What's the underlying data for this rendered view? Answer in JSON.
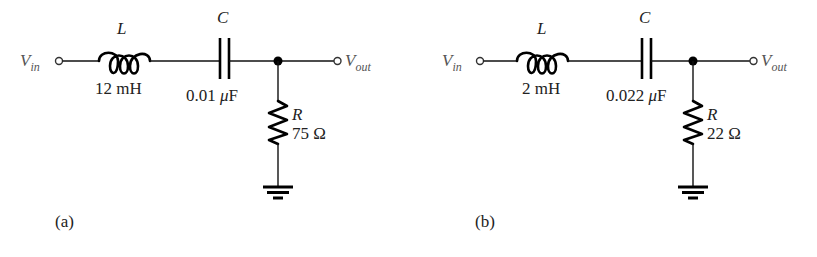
{
  "figure": {
    "circuits": [
      {
        "id": "a",
        "caption": "(a)",
        "input_label": {
          "main": "V",
          "sub": "in"
        },
        "output_label": {
          "main": "V",
          "sub": "out"
        },
        "inductor": {
          "symbol": "L",
          "value": "12 mH"
        },
        "capacitor": {
          "symbol": "C",
          "value_num": "0.01 ",
          "value_mu": "μ",
          "value_unit": "F"
        },
        "resistor": {
          "symbol": "R",
          "value": "75 Ω"
        }
      },
      {
        "id": "b",
        "caption": "(b)",
        "input_label": {
          "main": "V",
          "sub": "in"
        },
        "output_label": {
          "main": "V",
          "sub": "out"
        },
        "inductor": {
          "symbol": "L",
          "value": "2 mH"
        },
        "capacitor": {
          "symbol": "C",
          "value_num": "0.022 ",
          "value_mu": "μ",
          "value_unit": "F"
        },
        "resistor": {
          "symbol": "R",
          "value": "22 Ω"
        }
      }
    ],
    "colors": {
      "line": "#000000",
      "label": "#222222",
      "terminal_label": "#555555"
    }
  }
}
